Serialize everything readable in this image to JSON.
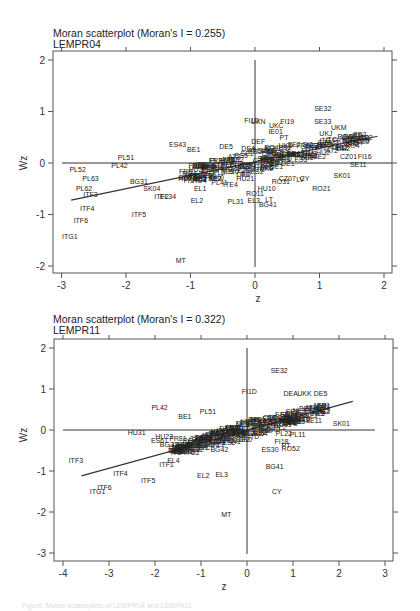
{
  "chart_data": [
    {
      "type": "scatter",
      "title": "Moran scatterplot (Moran's I = 0.255)",
      "subtitle": "LEMPR04",
      "xlabel": "z",
      "ylabel": "Wz",
      "xlim": [
        -3.1,
        2.1
      ],
      "ylim": [
        -2.2,
        2.1
      ],
      "xticks": [
        -3,
        -2,
        -1,
        0,
        1,
        2
      ],
      "yticks": [
        -2,
        -1,
        0,
        1,
        2
      ],
      "grid": false,
      "reference_lines": {
        "x": 0,
        "y": 0
      },
      "fit_line": {
        "x": [
          -2.85,
          1.9
        ],
        "y": [
          -0.72,
          0.52
        ]
      },
      "points": [
        {
          "label": "SE32",
          "z": 1.05,
          "wz": 1.05
        },
        {
          "label": "SE33",
          "z": 1.05,
          "wz": 0.81
        },
        {
          "label": "FI19",
          "z": 0.5,
          "wz": 0.8
        },
        {
          "label": "UKC",
          "z": 0.33,
          "wz": 0.73
        },
        {
          "label": "FI1D",
          "z": -0.05,
          "wz": 0.83
        },
        {
          "label": "UKN",
          "z": 0.05,
          "wz": 0.8
        },
        {
          "label": "IE01",
          "z": 0.32,
          "wz": 0.62
        },
        {
          "label": "UKM",
          "z": 1.3,
          "wz": 0.68
        },
        {
          "label": "UKJ",
          "z": 1.1,
          "wz": 0.57
        },
        {
          "label": "UKK",
          "z": 1.45,
          "wz": 0.5
        },
        {
          "label": "UKH",
          "z": 1.55,
          "wz": 0.4
        },
        {
          "label": "PT",
          "z": 0.45,
          "wz": 0.5
        },
        {
          "label": "DEF",
          "z": 0.05,
          "wz": 0.42
        },
        {
          "label": "ES43",
          "z": -1.2,
          "wz": 0.35
        },
        {
          "label": "BE1",
          "z": -0.95,
          "wz": 0.27
        },
        {
          "label": "DE5",
          "z": -0.45,
          "wz": 0.32
        },
        {
          "label": "DEA",
          "z": -0.1,
          "wz": 0.28
        },
        {
          "label": "FRF72",
          "z": -0.55,
          "wz": 0.05
        },
        {
          "label": "FR81",
          "z": -0.9,
          "wz": -0.05
        },
        {
          "label": "PL43",
          "z": -0.7,
          "wz": -0.12
        },
        {
          "label": "HU23",
          "z": -1.05,
          "wz": -0.3
        },
        {
          "label": "PL51",
          "z": -2.0,
          "wz": 0.1
        },
        {
          "label": "PL42",
          "z": -2.1,
          "wz": -0.05
        },
        {
          "label": "PL52",
          "z": -2.75,
          "wz": -0.12
        },
        {
          "label": "PL63",
          "z": -2.55,
          "wz": -0.3
        },
        {
          "label": "PL62",
          "z": -2.65,
          "wz": -0.5
        },
        {
          "label": "BG31",
          "z": -1.8,
          "wz": -0.35
        },
        {
          "label": "ITF3",
          "z": -2.55,
          "wz": -0.62
        },
        {
          "label": "ITF4",
          "z": -2.6,
          "wz": -0.88
        },
        {
          "label": "ITF5",
          "z": -1.8,
          "wz": -1.0
        },
        {
          "label": "ITF6",
          "z": -2.7,
          "wz": -1.12
        },
        {
          "label": "ITG1",
          "z": -2.87,
          "wz": -1.42
        },
        {
          "label": "SK04",
          "z": -1.6,
          "wz": -0.5
        },
        {
          "label": "ITF2",
          "z": -1.45,
          "wz": -0.65
        },
        {
          "label": "EL34",
          "z": -1.35,
          "wz": -0.65
        },
        {
          "label": "EL2",
          "z": -0.9,
          "wz": -0.72
        },
        {
          "label": "EL1",
          "z": -0.85,
          "wz": -0.5
        },
        {
          "label": "PL41",
          "z": -0.55,
          "wz": -0.37
        },
        {
          "label": "ITE4",
          "z": -0.38,
          "wz": -0.42
        },
        {
          "label": "HU21",
          "z": -0.15,
          "wz": -0.3
        },
        {
          "label": "PL31",
          "z": -0.3,
          "wz": -0.75
        },
        {
          "label": "EL3",
          "z": -0.02,
          "wz": -0.72
        },
        {
          "label": "RO11",
          "z": 0.0,
          "wz": -0.6
        },
        {
          "label": "LT",
          "z": 0.22,
          "wz": -0.7
        },
        {
          "label": "BG41",
          "z": 0.2,
          "wz": -0.8
        },
        {
          "label": "HU10",
          "z": 0.18,
          "wz": -0.5
        },
        {
          "label": "RO31",
          "z": 0.4,
          "wz": -0.35
        },
        {
          "label": "CZ07",
          "z": 0.5,
          "wz": -0.3
        },
        {
          "label": "LV",
          "z": 0.7,
          "wz": -0.32
        },
        {
          "label": "CY",
          "z": 0.77,
          "wz": -0.3
        },
        {
          "label": "RO21",
          "z": 1.03,
          "wz": -0.5
        },
        {
          "label": "SK01",
          "z": 1.35,
          "wz": -0.25
        },
        {
          "label": "SE11",
          "z": 1.6,
          "wz": -0.02
        },
        {
          "label": "SE2",
          "z": 1.0,
          "wz": 0.12
        },
        {
          "label": "FI16",
          "z": 1.7,
          "wz": 0.12
        },
        {
          "label": "CZ01",
          "z": 1.45,
          "wz": 0.12
        },
        {
          "label": "FI13",
          "z": 0.3,
          "wz": 0.2
        },
        {
          "label": "MT",
          "z": -1.15,
          "wz": -1.9
        }
      ]
    },
    {
      "type": "scatter",
      "title": "Moran scatterplot (Moran's I = 0.322)",
      "subtitle": "LEMPR11",
      "xlabel": "z",
      "ylabel": "Wz",
      "xlim": [
        -4.2,
        3.2
      ],
      "ylim": [
        -3.1,
        2.2
      ],
      "xticks": [
        -4,
        -3,
        -2,
        -1,
        0,
        1,
        2,
        3
      ],
      "yticks": [
        -3,
        -2,
        -1,
        0,
        1,
        2
      ],
      "grid": false,
      "reference_lines": {
        "x": 0,
        "y": 0
      },
      "fit_line": {
        "x": [
          -3.6,
          2.3
        ],
        "y": [
          -1.12,
          0.7
        ]
      },
      "points": [
        {
          "label": "SE32",
          "z": 0.7,
          "wz": 1.45
        },
        {
          "label": "FI1D",
          "z": 0.05,
          "wz": 0.95
        },
        {
          "label": "DEA",
          "z": 0.95,
          "wz": 0.9
        },
        {
          "label": "UKK",
          "z": 1.25,
          "wz": 0.9
        },
        {
          "label": "DE5",
          "z": 1.6,
          "wz": 0.9
        },
        {
          "label": "SE11",
          "z": 1.45,
          "wz": 0.22
        },
        {
          "label": "SK01",
          "z": 2.05,
          "wz": 0.15
        },
        {
          "label": "PL11",
          "z": 1.1,
          "wz": -0.12
        },
        {
          "label": "PL22",
          "z": 0.8,
          "wz": -0.08
        },
        {
          "label": "PL42",
          "z": -1.9,
          "wz": 0.55
        },
        {
          "label": "PL51",
          "z": -0.85,
          "wz": 0.45
        },
        {
          "label": "BE1",
          "z": -1.35,
          "wz": 0.32
        },
        {
          "label": "HU31",
          "z": -2.4,
          "wz": -0.05
        },
        {
          "label": "HU23",
          "z": -1.8,
          "wz": -0.15
        },
        {
          "label": "ES61",
          "z": -1.9,
          "wz": -0.25
        },
        {
          "label": "FR81",
          "z": -1.5,
          "wz": -0.2
        },
        {
          "label": "BG31",
          "z": -1.7,
          "wz": -0.35
        },
        {
          "label": "ITG2",
          "z": -1.2,
          "wz": -0.55
        },
        {
          "label": "EL4",
          "z": -1.6,
          "wz": -0.75
        },
        {
          "label": "ITF1",
          "z": -1.75,
          "wz": -0.85
        },
        {
          "label": "BG42",
          "z": -0.6,
          "wz": -0.48
        },
        {
          "label": "EL2",
          "z": -0.95,
          "wz": -1.1
        },
        {
          "label": "EL3",
          "z": -0.55,
          "wz": -1.08
        },
        {
          "label": "ES30",
          "z": 0.5,
          "wz": -0.48
        },
        {
          "label": "RO52",
          "z": 0.95,
          "wz": -0.45
        },
        {
          "label": "PT",
          "z": 0.85,
          "wz": -0.38
        },
        {
          "label": "FI18",
          "z": 0.75,
          "wz": -0.28
        },
        {
          "label": "BG41",
          "z": 0.6,
          "wz": -0.9
        },
        {
          "label": "CY",
          "z": 0.65,
          "wz": -1.5
        },
        {
          "label": "ITF3",
          "z": -3.72,
          "wz": -0.75
        },
        {
          "label": "ITF4",
          "z": -2.75,
          "wz": -1.07
        },
        {
          "label": "ITF5",
          "z": -2.15,
          "wz": -1.22
        },
        {
          "label": "ITF6",
          "z": -3.1,
          "wz": -1.4
        },
        {
          "label": "ITG1",
          "z": -3.25,
          "wz": -1.5
        },
        {
          "label": "MT",
          "z": -0.45,
          "wz": -2.05
        }
      ]
    }
  ],
  "caption": "Figure: Moran scatterplots of LEMPR04 and LEMPR11"
}
